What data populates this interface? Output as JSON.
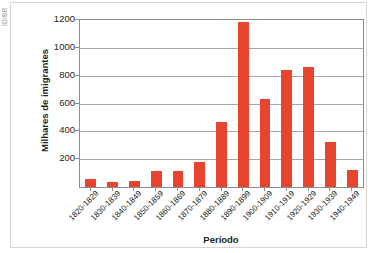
{
  "watermark": {
    "text": "ID/BR"
  },
  "chart_data": {
    "type": "bar",
    "title": "",
    "xlabel": "Período",
    "ylabel": "Milhares de imigrantes",
    "ylim": [
      0,
      1200
    ],
    "yticks": [
      200,
      400,
      600,
      800,
      1000,
      1200
    ],
    "grid": "horizontal",
    "legend": "none",
    "bar_color": "#e8442e",
    "categories": [
      "1820-1829",
      "1830-1839",
      "1840-1849",
      "1850-1859",
      "1860-1869",
      "1870-1879",
      "1880-1889",
      "1890-1899",
      "1900-1909",
      "1910-1919",
      "1920-1929",
      "1930-1939",
      "1940-1949"
    ],
    "values": [
      55,
      35,
      45,
      115,
      115,
      180,
      465,
      1185,
      635,
      840,
      865,
      320,
      125
    ]
  }
}
